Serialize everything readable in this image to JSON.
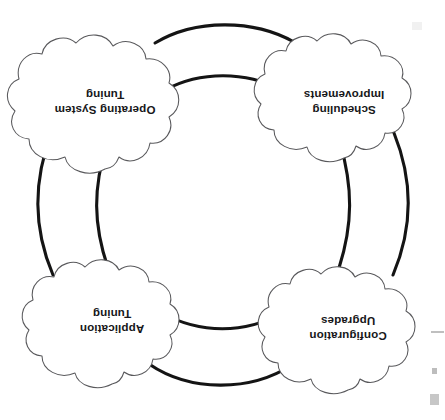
{
  "document": {
    "type": "cycle-diagram",
    "orientation": "rotated-180",
    "background_color": "#ffffff",
    "node_outline_color": "#59595c",
    "connector_color": "#141414",
    "text_color": "#17171a"
  },
  "diagram": {
    "shape": "closed-loop-ring",
    "node_shape": "cloud",
    "node_count": 4,
    "nodes": [
      {
        "id": "configuration-upgrades",
        "position": "top-left",
        "line1": "Configuration",
        "line2": "Upgrades",
        "cx": 97,
        "cy": 92
      },
      {
        "id": "application-tuning",
        "position": "top-right",
        "line1": "Application",
        "line2": "Tuning",
        "cx": 333,
        "cy": 99
      },
      {
        "id": "scheduling-improvements",
        "position": "bottom-left",
        "line1": "Scheduling",
        "line2": "Improvements",
        "cx": 101,
        "cy": 318
      },
      {
        "id": "operating-system-tuning",
        "position": "bottom-right",
        "line1": "Operating System",
        "line2": "Tuning",
        "cx": 340,
        "cy": 319
      }
    ],
    "connectors": [
      {
        "id": "connector-top",
        "from": "configuration-upgrades",
        "to": "application-tuning"
      },
      {
        "id": "connector-right",
        "from": "application-tuning",
        "to": "operating-system-tuning"
      },
      {
        "id": "connector-bottom",
        "from": "operating-system-tuning",
        "to": "scheduling-improvements"
      },
      {
        "id": "connector-left",
        "from": "scheduling-improvements",
        "to": "configuration-upgrades"
      }
    ]
  }
}
